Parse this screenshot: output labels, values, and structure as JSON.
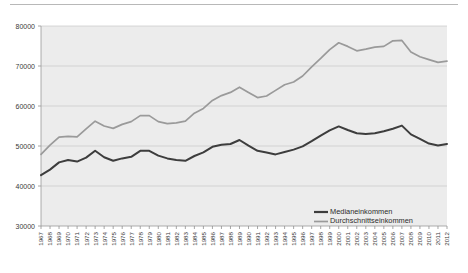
{
  "chart_data": {
    "type": "line",
    "title": "",
    "subtitle": "",
    "xlabel": "",
    "ylabel": "",
    "ylim": [
      30000,
      80000
    ],
    "ytick_values": [
      30000,
      40000,
      50000,
      60000,
      70000,
      80000
    ],
    "ytick_labels": [
      "30000",
      "40000",
      "50000",
      "60000",
      "70000",
      "80000"
    ],
    "grid": true,
    "legend_position": "bottom-right",
    "x": [
      1967,
      1968,
      1969,
      1970,
      1971,
      1972,
      1973,
      1974,
      1975,
      1976,
      1977,
      1978,
      1979,
      1980,
      1981,
      1982,
      1983,
      1984,
      1985,
      1986,
      1987,
      1988,
      1989,
      1990,
      1991,
      1992,
      1993,
      1994,
      1995,
      1996,
      1997,
      1998,
      1999,
      2000,
      2001,
      2002,
      2003,
      2004,
      2005,
      2006,
      2007,
      2008,
      2009,
      2010,
      2011,
      2012
    ],
    "categories": [
      "1967",
      "1968",
      "1969",
      "1970",
      "1971",
      "1972",
      "1973",
      "1974",
      "1975",
      "1976",
      "1977",
      "1978",
      "1979",
      "1980",
      "1981",
      "1982",
      "1983",
      "1984",
      "1985",
      "1986",
      "1987",
      "1988",
      "1989",
      "1990",
      "1991",
      "1992",
      "1993",
      "1994",
      "1995",
      "1996",
      "1997",
      "1998",
      "1999",
      "2000",
      "2001",
      "2002",
      "2003",
      "2004",
      "2005",
      "2006",
      "2007",
      "2008",
      "2009",
      "2010",
      "2011",
      "2012"
    ],
    "series": [
      {
        "name": "Medianeinkommen",
        "color": "#3d3d3d",
        "values": [
          42700,
          44100,
          45900,
          46500,
          46100,
          47100,
          48800,
          47200,
          46300,
          46900,
          47300,
          48800,
          48800,
          47600,
          46900,
          46500,
          46300,
          47500,
          48400,
          49800,
          50300,
          50500,
          51500,
          50100,
          48800,
          48400,
          47900,
          48500,
          49100,
          49900,
          51200,
          52600,
          53900,
          54900,
          54000,
          53200,
          53000,
          53200,
          53700,
          54300,
          55100,
          52900,
          51800,
          50600,
          50100,
          50500
        ]
      },
      {
        "name": "Durchschnittseinkommen",
        "color": "#9a9a9a",
        "values": [
          47900,
          50200,
          52200,
          52400,
          52300,
          54300,
          56200,
          55000,
          54400,
          55400,
          56100,
          57600,
          57600,
          56100,
          55600,
          55800,
          56200,
          58200,
          59400,
          61400,
          62600,
          63400,
          64700,
          63400,
          62100,
          62500,
          63900,
          65300,
          66000,
          67500,
          69800,
          71900,
          74100,
          75800,
          74900,
          73800,
          74200,
          74700,
          74900,
          76300,
          76400,
          73500,
          72300,
          71600,
          70900,
          71200
        ]
      }
    ]
  },
  "legend": {
    "items": [
      {
        "label": "Medianeinkommen",
        "color": "#3d3d3d"
      },
      {
        "label": "Durchschnittseinkommen",
        "color": "#9a9a9a"
      }
    ]
  }
}
